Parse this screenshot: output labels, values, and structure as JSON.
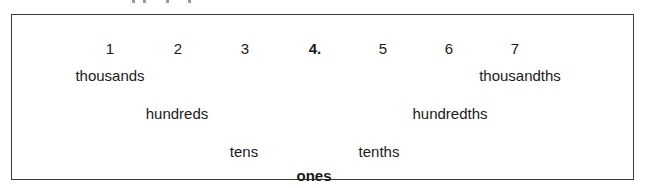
{
  "diagram": {
    "digits": [
      {
        "label": "1",
        "x": 110,
        "bold": false
      },
      {
        "label": "2",
        "x": 178,
        "bold": false
      },
      {
        "label": "3",
        "x": 245,
        "bold": false
      },
      {
        "label": "4.",
        "x": 315,
        "bold": true
      },
      {
        "label": "5",
        "x": 383,
        "bold": false
      },
      {
        "label": "6",
        "x": 449,
        "bold": false
      },
      {
        "label": "7",
        "x": 515,
        "bold": false
      }
    ],
    "place_values": {
      "thousands": "thousands",
      "hundreds": "hundreds",
      "tens": "tens",
      "ones": "ones",
      "tenths": "tenths",
      "hundredths": "hundredths",
      "thousandths": "thousandths"
    }
  }
}
